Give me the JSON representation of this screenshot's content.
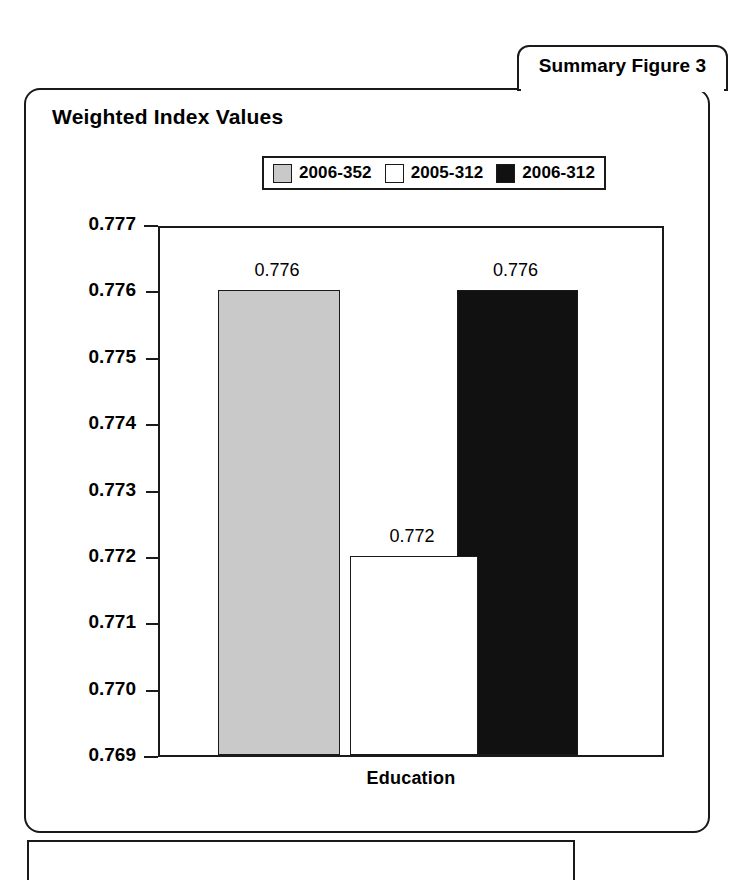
{
  "figure_tab": {
    "label": "Summary Figure 3"
  },
  "chart": {
    "title": "Weighted Index Values"
  },
  "colors": {
    "series_gray": "#c9c9c9",
    "series_white": "#ffffff",
    "series_black": "#111111",
    "frame": "#1a1a1a",
    "background": "#ffffff"
  },
  "chart_data": {
    "type": "bar",
    "title": "Weighted Index Values",
    "xlabel": "Education",
    "ylabel": "",
    "categories": [
      "Education"
    ],
    "series": [
      {
        "name": "2006-352",
        "values": [
          0.776
        ],
        "color": "#c9c9c9",
        "label": "0.776"
      },
      {
        "name": "2005-312",
        "values": [
          0.772
        ],
        "color": "#ffffff",
        "label": "0.772"
      },
      {
        "name": "2006-312",
        "values": [
          0.776
        ],
        "color": "#111111",
        "label": "0.776"
      }
    ],
    "ylim": [
      0.769,
      0.777
    ],
    "ytick_labels": [
      "0.777",
      "0.776",
      "0.775",
      "0.774",
      "0.773",
      "0.772",
      "0.771",
      "0.770",
      "0.769"
    ],
    "ytick_values": [
      0.777,
      0.776,
      0.775,
      0.774,
      0.773,
      0.772,
      0.771,
      0.77,
      0.769
    ],
    "grid": false,
    "legend_position": "top-center",
    "legend_entries": [
      "2006-352",
      "2005-312",
      "2006-312"
    ],
    "data_labels": [
      "0.776",
      "0.772",
      "0.776"
    ]
  }
}
